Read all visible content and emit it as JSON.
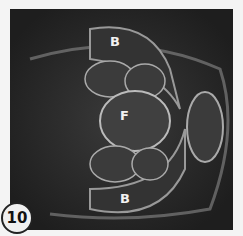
{
  "figure": {
    "panel_number": "10",
    "labels": {
      "top": "B",
      "center": "F",
      "bottom": "B"
    },
    "colors": {
      "background": "#262626",
      "border": "#f4f4f4",
      "label_text": "#f2f2f2"
    }
  }
}
